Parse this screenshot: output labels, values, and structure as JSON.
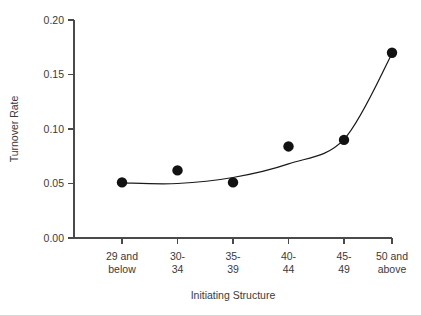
{
  "chart_data": {
    "type": "scatter",
    "title": "",
    "xlabel": "Initiating Structure",
    "ylabel": "Turnover Rate",
    "categories": [
      "29 and below",
      "30-34",
      "35-39",
      "40-44",
      "45-49",
      "50 and above"
    ],
    "category_lines": [
      [
        "29 and",
        "below"
      ],
      [
        "30-",
        "34"
      ],
      [
        "35-",
        "39"
      ],
      [
        "40-",
        "44"
      ],
      [
        "45-",
        "49"
      ],
      [
        "50 and",
        "above"
      ]
    ],
    "values": [
      0.051,
      0.062,
      0.051,
      0.084,
      0.09,
      0.17
    ],
    "ylim": [
      0.0,
      0.2
    ],
    "ytick_labels": [
      "0.00",
      "0.05",
      "0.10",
      "0.15",
      "0.20"
    ],
    "ytick_values": [
      0.0,
      0.05,
      0.1,
      0.15,
      0.2
    ],
    "grid": false,
    "legend": "none",
    "series": [
      {
        "name": "Turnover Rate",
        "marker": "filled-circle",
        "marker_color": "#121212",
        "values": [
          0.051,
          0.062,
          0.051,
          0.084,
          0.09,
          0.17
        ]
      },
      {
        "name": "fitted exponential curve",
        "marker": "none",
        "line_color": "#1a1a1a",
        "values": [
          0.0505,
          0.05,
          0.0555,
          0.068,
          0.0905,
          0.169
        ]
      }
    ]
  },
  "axes": {
    "y_title": "Turnover Rate",
    "x_title": "Initiating Structure"
  },
  "colors": {
    "axis": "#4a4a4a",
    "marker": "#121212",
    "curve": "#1a1a1a",
    "text": "#3a3a3a",
    "background": "#ffffff"
  }
}
